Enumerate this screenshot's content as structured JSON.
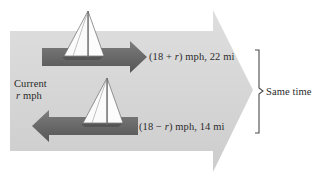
{
  "figure": {
    "colors": {
      "background": "#ffffff",
      "big_arrow": "#d8d8d8",
      "big_arrow_shade": "#cfcfcf",
      "dark_arrow": "#6f6f6f",
      "dark_arrow_shade": "#585858",
      "sail": "#fdfdfd",
      "sail_outline": "#6a6a6a",
      "text": "#2b2b2b",
      "brace": "#4a4a4a"
    }
  },
  "labels": {
    "downstream": {
      "open_paren": "(18 + ",
      "variable": "r",
      "close": ") mph, 22 mi",
      "full": "(18 + r) mph, 22 mi",
      "speed_expression": "18 + r",
      "speed_units": "mph",
      "distance": "22 mi"
    },
    "upstream": {
      "open_paren": "(18 − ",
      "variable": "r",
      "close": ") mph, 14 mi",
      "full": "(18 − r) mph, 14 mi",
      "speed_expression": "18 − r",
      "speed_units": "mph",
      "distance": "14 mi"
    },
    "current": {
      "line1": "Current",
      "variable": "r",
      "line2_rest": " mph",
      "full": "Current r mph"
    },
    "same_time": {
      "text": "Same time"
    }
  },
  "icons": {
    "sailboat_top": "sailboat-icon",
    "sailboat_bottom": "sailboat-icon",
    "arrow_right": "arrow-right-icon",
    "arrow_left": "arrow-left-icon",
    "big_current_arrow": "current-arrow-icon",
    "brace": "right-brace-icon"
  }
}
